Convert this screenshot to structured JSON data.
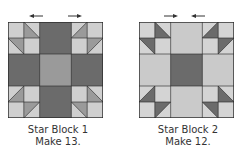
{
  "colors": {
    "light": "#cfcfcf",
    "lighter": "#d9d9d9",
    "medium": "#9a9a9a",
    "dark": "#6b6b6b",
    "outline": "#2a2a2a"
  },
  "blocks": [
    {
      "title": "Star Block 1",
      "instruction": "Make 13.",
      "center_color": "medium",
      "arm_color": "dark",
      "corner_triangle_color": "medium",
      "arrows": [
        "left",
        "right"
      ]
    },
    {
      "title": "Star Block 2",
      "instruction": "Make 12.",
      "center_color": "dark",
      "arm_color": "light",
      "corner_triangle_color": "dark",
      "arrows": [
        "right",
        "left"
      ]
    }
  ]
}
